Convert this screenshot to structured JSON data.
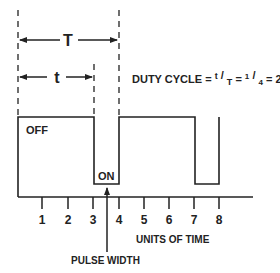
{
  "diagram": {
    "period_label": "T",
    "pulse_label": "t",
    "duty_cycle": {
      "prefix": "DUTY CYCLE = ",
      "frac1_num": "t",
      "frac1_den": "T",
      "eq": " = ",
      "frac2_num": "1",
      "frac2_den": "4",
      "result": " = 25%"
    },
    "off_label": "OFF",
    "on_label": "ON",
    "ticks": [
      "1",
      "2",
      "3",
      "4",
      "5",
      "6",
      "7",
      "8"
    ],
    "x_axis_label": "UNITS OF TIME",
    "pulse_width_label": "PULSE WIDTH",
    "colors": {
      "line": "#222222",
      "background": "#ffffff"
    }
  }
}
